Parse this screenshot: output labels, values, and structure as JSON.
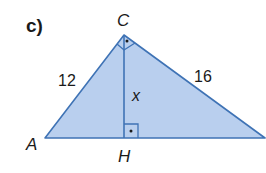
{
  "figure": {
    "part_label": "c)",
    "vertices": {
      "C": "C",
      "A": "A",
      "H": "H"
    },
    "side_labels": {
      "AC": "12",
      "BC": "16",
      "CH": "x"
    },
    "right_angles": [
      "C",
      "H"
    ],
    "colors": {
      "fill": "#b9cfee",
      "stroke": "#3f73b5",
      "text": "#1a1a1a"
    }
  }
}
